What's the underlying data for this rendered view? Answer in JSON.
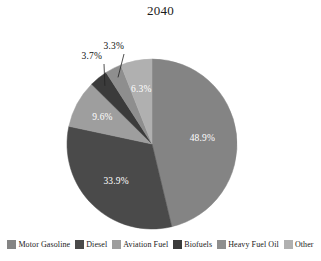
{
  "chart_data": {
    "type": "pie",
    "title": "2040",
    "xlabel": "",
    "ylabel": "",
    "legend_position": "bottom",
    "grid": false,
    "unit": "%",
    "categories": [
      "Motor Gasoline",
      "Diesel",
      "Aviation Fuel",
      "Biofuels",
      "Heavy Fuel Oil",
      "Other"
    ],
    "values": [
      48.9,
      33.9,
      9.6,
      3.7,
      3.3,
      6.3
    ],
    "labels": [
      "48.9%",
      "33.9%",
      "9.6%",
      "3.7%",
      "3.3%",
      "6.3%"
    ],
    "colors": [
      "#848484",
      "#4a4a4a",
      "#9e9e9e",
      "#3b3b3b",
      "#8e8e8e",
      "#b0b0b0"
    ],
    "slices": [
      {
        "name": "Motor Gasoline",
        "value": 48.9,
        "label": "48.9%",
        "color": "#848484",
        "label_placement": "inside",
        "label_color": "#ffffff"
      },
      {
        "name": "Diesel",
        "value": 33.9,
        "label": "33.9%",
        "color": "#4a4a4a",
        "label_placement": "inside",
        "label_color": "#ffffff"
      },
      {
        "name": "Aviation Fuel",
        "value": 9.6,
        "label": "9.6%",
        "color": "#9e9e9e",
        "label_placement": "inside",
        "label_color": "#ffffff"
      },
      {
        "name": "Biofuels",
        "value": 3.7,
        "label": "3.7%",
        "color": "#3b3b3b",
        "label_placement": "callout",
        "label_color": "#111111"
      },
      {
        "name": "Heavy Fuel Oil",
        "value": 3.3,
        "label": "3.3%",
        "color": "#8e8e8e",
        "label_placement": "callout",
        "label_color": "#111111"
      },
      {
        "name": "Other",
        "value": 6.3,
        "label": "6.3%",
        "color": "#b0b0b0",
        "label_placement": "inside",
        "label_color": "#ffffff"
      }
    ]
  },
  "legend": {
    "items": [
      {
        "label": "Motor Gasoline",
        "color": "#848484"
      },
      {
        "label": "Diesel",
        "color": "#4a4a4a"
      },
      {
        "label": "Aviation Fuel",
        "color": "#9e9e9e"
      },
      {
        "label": "Biofuels",
        "color": "#3b3b3b"
      },
      {
        "label": "Heavy Fuel Oil",
        "color": "#8e8e8e"
      },
      {
        "label": "Other",
        "color": "#b0b0b0"
      }
    ]
  }
}
